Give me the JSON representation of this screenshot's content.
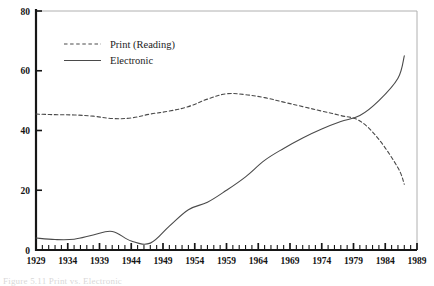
{
  "figure": {
    "caption": "Figure 5.11  Print vs. Electronic"
  },
  "legend": {
    "position": "top-left-inside",
    "entries": [
      {
        "label": "Print (Reading)",
        "style": "dashed",
        "color": "#4a4a4a"
      },
      {
        "label": "Electronic",
        "style": "solid",
        "color": "#4a4a4a"
      }
    ]
  },
  "axes": {
    "y": {
      "ticks": [
        "0",
        "20",
        "40",
        "60",
        "80"
      ],
      "min": 0,
      "max": 80
    },
    "x": {
      "ticks": [
        "1929",
        "1934",
        "1939",
        "1944",
        "1949",
        "1954",
        "1959",
        "1964",
        "1969",
        "1974",
        "1979",
        "1984",
        "1989"
      ],
      "min": 1929,
      "max": 1989
    }
  },
  "chart_data": {
    "type": "line",
    "title": "",
    "subtitle": "",
    "xlabel": "",
    "ylabel": "",
    "xlim": [
      1929,
      1989
    ],
    "ylim": [
      0,
      80
    ],
    "grid": false,
    "legend_position": "upper left",
    "xticklabels": [
      "1929",
      "1934",
      "1939",
      "1944",
      "1949",
      "1954",
      "1959",
      "1964",
      "1969",
      "1974",
      "1979",
      "1984",
      "1989"
    ],
    "yticklabels": [
      "0",
      "20",
      "40",
      "60",
      "80"
    ],
    "x": [
      1929,
      1932,
      1935,
      1938,
      1941,
      1944,
      1947,
      1950,
      1953,
      1956,
      1959,
      1962,
      1965,
      1968,
      1971,
      1974,
      1977,
      1980,
      1983,
      1986,
      1987
    ],
    "series": [
      {
        "name": "Print (Reading)",
        "style": "dashed",
        "color": "#4a4a4a",
        "values": [
          45.5,
          45.3,
          45.2,
          44.8,
          44.0,
          44.2,
          45.5,
          46.5,
          48.0,
          50.5,
          52.3,
          52.0,
          51.0,
          49.5,
          48.0,
          46.5,
          45.0,
          43.2,
          37.0,
          27.5,
          22.0
        ]
      },
      {
        "name": "Electronic",
        "style": "solid",
        "color": "#4a4a4a",
        "values": [
          4.0,
          3.5,
          3.6,
          5.0,
          6.2,
          3.0,
          2.3,
          8.0,
          13.5,
          16.0,
          20.0,
          24.5,
          30.0,
          34.0,
          37.5,
          40.5,
          43.0,
          45.0,
          50.0,
          57.5,
          65.0
        ]
      }
    ]
  }
}
